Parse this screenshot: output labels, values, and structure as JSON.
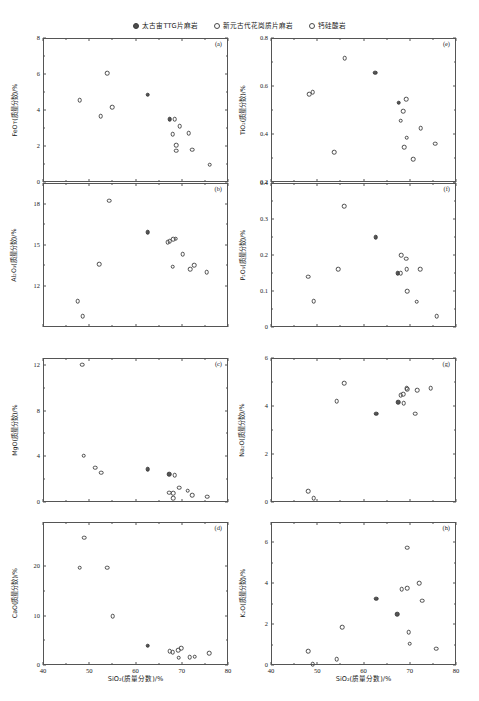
{
  "legend": {
    "items": [
      {
        "label": "太古宙TTG片麻岩",
        "marker": "filled-circle"
      },
      {
        "label": "新元古代花岗质片麻岩",
        "marker": "open-circle"
      },
      {
        "label": "钙硅酸岩",
        "marker": "open-circle"
      }
    ]
  },
  "xaxis": {
    "label": "SiO₂(质量分数)/%",
    "min": 40,
    "max": 80,
    "ticks": [
      40,
      50,
      60,
      70,
      80
    ]
  },
  "colors": {
    "filled_marker": "#555555",
    "open_marker": "#4a4a4a",
    "axis": "#555555",
    "background": "#ffffff"
  },
  "chart_data": [
    {
      "type": "scatter",
      "panel": "(a)",
      "title": "",
      "xlabel": "SiO₂(质量分数)/%",
      "ylabel": "FeOᴛ(质量分数)/%",
      "xlim": [
        40,
        80
      ],
      "ylim": [
        0,
        8
      ],
      "yticks": [
        0,
        2,
        4,
        6,
        8
      ],
      "grid": false,
      "series": [
        {
          "name": "太古宙TTG片麻岩",
          "marker": "filled-circle",
          "points": [
            [
              62.6,
              4.85
            ],
            [
              67.4,
              3.5
            ]
          ]
        },
        {
          "name": "新元古代花岗质片麻岩/钙硅酸岩",
          "marker": "open-circle",
          "points": [
            [
              53.9,
              6.05
            ],
            [
              47.9,
              4.55
            ],
            [
              54.9,
              4.15
            ],
            [
              52.5,
              3.65
            ],
            [
              68.5,
              3.5
            ],
            [
              69.6,
              3.1
            ],
            [
              68.0,
              2.65
            ],
            [
              71.5,
              2.7
            ],
            [
              68.8,
              2.05
            ],
            [
              68.8,
              1.75
            ],
            [
              72.3,
              1.8
            ],
            [
              76.0,
              0.95
            ]
          ]
        }
      ]
    },
    {
      "type": "scatter",
      "panel": "(b)",
      "xlabel": "SiO₂(质量分数)/%",
      "ylabel": "Al₂O₃(质量分数)/%",
      "xlim": [
        40,
        80
      ],
      "ylim": [
        9,
        19.5
      ],
      "yticks": [
        12,
        15,
        18
      ],
      "grid": false,
      "series": [
        {
          "name": "太古宙TTG片麻岩",
          "marker": "filled-circle",
          "points": [
            [
              62.6,
              15.9
            ]
          ]
        },
        {
          "name": "新元古代花岗质片麻岩/钙硅酸岩",
          "marker": "open-circle",
          "points": [
            [
              54.3,
              18.2
            ],
            [
              52.2,
              13.6
            ],
            [
              47.5,
              10.9
            ],
            [
              48.6,
              9.8
            ],
            [
              67.0,
              15.2
            ],
            [
              67.4,
              15.25
            ],
            [
              68.2,
              15.4
            ],
            [
              68.7,
              15.45
            ],
            [
              70.2,
              14.3
            ],
            [
              68.0,
              13.4
            ],
            [
              71.8,
              13.2
            ],
            [
              72.7,
              13.5
            ],
            [
              75.4,
              13.0
            ]
          ]
        }
      ]
    },
    {
      "type": "scatter",
      "panel": "(c)",
      "xlabel": "SiO₂(质量分数)/%",
      "ylabel": "MgO(质量分数)/%",
      "xlim": [
        40,
        80
      ],
      "ylim": [
        0,
        12.6
      ],
      "yticks": [
        0,
        4,
        8,
        12
      ],
      "grid": false,
      "series": [
        {
          "name": "太古宙TTG片麻岩",
          "marker": "filled-circle",
          "points": [
            [
              62.6,
              2.85
            ],
            [
              67.3,
              2.45
            ]
          ]
        },
        {
          "name": "新元古代花岗质片麻岩/钙硅酸岩",
          "marker": "open-circle",
          "points": [
            [
              48.5,
              12.0
            ],
            [
              48.8,
              4.05
            ],
            [
              51.3,
              3.0
            ],
            [
              52.6,
              2.55
            ],
            [
              68.5,
              2.35
            ],
            [
              69.5,
              1.25
            ],
            [
              67.3,
              0.8
            ],
            [
              68.2,
              0.75
            ],
            [
              68.2,
              0.35
            ],
            [
              71.3,
              1.0
            ],
            [
              72.3,
              0.6
            ],
            [
              75.5,
              0.45
            ]
          ]
        }
      ]
    },
    {
      "type": "scatter",
      "panel": "(d)",
      "xlabel": "SiO₂(质量分数)/%",
      "ylabel": "CaO(质量分数)/%",
      "xlim": [
        40,
        80
      ],
      "ylim": [
        0,
        29
      ],
      "yticks": [
        0,
        10,
        20
      ],
      "grid": false,
      "series": [
        {
          "name": "太古宙TTG片麻岩",
          "marker": "filled-circle",
          "points": [
            [
              62.6,
              3.9
            ]
          ]
        },
        {
          "name": "新元古代花岗质片麻岩/钙硅酸岩",
          "marker": "open-circle",
          "points": [
            [
              48.9,
              25.8
            ],
            [
              47.9,
              19.7
            ],
            [
              53.9,
              19.7
            ],
            [
              55.1,
              9.9
            ],
            [
              67.4,
              2.8
            ],
            [
              68.0,
              2.6
            ],
            [
              69.2,
              3.0
            ],
            [
              69.9,
              3.4
            ],
            [
              69.3,
              1.5
            ],
            [
              71.7,
              1.6
            ],
            [
              72.8,
              1.7
            ],
            [
              75.9,
              2.4
            ]
          ]
        }
      ]
    },
    {
      "type": "scatter",
      "panel": "(e)",
      "xlabel": "SiO₂(质量分数)/%",
      "ylabel": "TiO₂(质量分数)/%",
      "xlim": [
        40,
        80
      ],
      "ylim": [
        0.2,
        0.8
      ],
      "yticks": [
        0.2,
        0.4,
        0.6,
        0.8
      ],
      "grid": false,
      "series": [
        {
          "name": "太古宙TTG片麻岩",
          "marker": "filled-circle",
          "points": [
            [
              62.5,
              0.655
            ],
            [
              67.6,
              0.53
            ]
          ]
        },
        {
          "name": "新元古代花岗质片麻岩/钙硅酸岩",
          "marker": "open-circle",
          "points": [
            [
              55.9,
              0.715
            ],
            [
              48.2,
              0.565
            ],
            [
              49.0,
              0.575
            ],
            [
              69.2,
              0.545
            ],
            [
              68.6,
              0.495
            ],
            [
              68.0,
              0.455
            ],
            [
              53.7,
              0.325
            ],
            [
              69.3,
              0.385
            ],
            [
              68.8,
              0.345
            ],
            [
              72.4,
              0.425
            ],
            [
              70.8,
              0.295
            ],
            [
              75.5,
              0.36
            ]
          ]
        }
      ]
    },
    {
      "type": "scatter",
      "panel": "(f)",
      "xlabel": "SiO₂(质量分数)/%",
      "ylabel": "P₂O₅(质量分数)/%",
      "xlim": [
        40,
        80
      ],
      "ylim": [
        0.0,
        0.4
      ],
      "yticks": [
        0.0,
        0.1,
        0.2,
        0.3,
        0.4
      ],
      "grid": false,
      "series": [
        {
          "name": "太古宙TTG片麻岩",
          "marker": "filled-circle",
          "points": [
            [
              62.6,
              0.25
            ],
            [
              67.4,
              0.15
            ]
          ]
        },
        {
          "name": "新元古代花岗质片麻岩/钙硅酸岩",
          "marker": "open-circle",
          "points": [
            [
              55.8,
              0.335
            ],
            [
              54.5,
              0.16
            ],
            [
              48.0,
              0.14
            ],
            [
              49.2,
              0.072
            ],
            [
              68.2,
              0.2
            ],
            [
              69.2,
              0.19
            ],
            [
              69.3,
              0.16
            ],
            [
              68.0,
              0.15
            ],
            [
              69.5,
              0.1
            ],
            [
              71.5,
              0.07
            ],
            [
              72.2,
              0.16
            ],
            [
              75.8,
              0.03
            ]
          ]
        }
      ]
    },
    {
      "type": "scatter",
      "panel": "(g)",
      "xlabel": "SiO₂(质量分数)/%",
      "ylabel": "Na₂O(质量分数)/%",
      "xlim": [
        40,
        80
      ],
      "ylim": [
        0,
        6
      ],
      "yticks": [
        0,
        2,
        4,
        6
      ],
      "grid": false,
      "series": [
        {
          "name": "太古宙TTG片麻岩",
          "marker": "filled-circle",
          "points": [
            [
              62.8,
              3.68
            ],
            [
              67.5,
              4.15
            ]
          ]
        },
        {
          "name": "新元古代花岗质片麻岩/钙硅酸岩",
          "marker": "open-circle",
          "points": [
            [
              55.8,
              4.95
            ],
            [
              54.2,
              4.2
            ],
            [
              68.0,
              4.45
            ],
            [
              68.6,
              4.5
            ],
            [
              69.3,
              4.75
            ],
            [
              69.5,
              4.7
            ],
            [
              68.7,
              4.12
            ],
            [
              71.6,
              4.65
            ],
            [
              71.2,
              3.68
            ],
            [
              74.5,
              4.75
            ],
            [
              48.0,
              0.45
            ],
            [
              49.2,
              0.15
            ]
          ]
        }
      ]
    },
    {
      "type": "scatter",
      "panel": "(h)",
      "xlabel": "SiO₂(质量分数)/%",
      "ylabel": "K₂O(质量分数)/%",
      "xlim": [
        40,
        80
      ],
      "ylim": [
        0,
        7
      ],
      "yticks": [
        0,
        2,
        4,
        6
      ],
      "grid": false,
      "series": [
        {
          "name": "太古宙TTG片麻岩",
          "marker": "filled-circle",
          "points": [
            [
              62.7,
              3.25
            ],
            [
              67.3,
              2.48
            ]
          ]
        },
        {
          "name": "新元古代花岗质片麻岩/钙硅酸岩",
          "marker": "open-circle",
          "points": [
            [
              69.4,
              5.75
            ],
            [
              72.1,
              4.0
            ],
            [
              68.3,
              3.72
            ],
            [
              69.4,
              3.75
            ],
            [
              72.7,
              3.15
            ],
            [
              55.4,
              1.85
            ],
            [
              69.8,
              1.6
            ],
            [
              70.0,
              1.05
            ],
            [
              48.0,
              0.68
            ],
            [
              49.0,
              0.05
            ],
            [
              54.2,
              0.27
            ],
            [
              75.7,
              0.8
            ]
          ]
        }
      ]
    }
  ]
}
